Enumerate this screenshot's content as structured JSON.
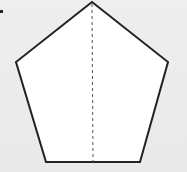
{
  "diagram": {
    "shape": "regular-pentagon",
    "fill": "#ffffff",
    "stroke": "#222222",
    "stroke_width": 2,
    "vertices": [
      [
        92,
        2
      ],
      [
        168,
        62
      ],
      [
        140,
        162
      ],
      [
        46,
        162
      ],
      [
        16,
        62
      ]
    ],
    "symmetry_line": {
      "style": "dashed",
      "color": "#555555",
      "x1": 92,
      "y1": 4,
      "x2": 93,
      "y2": 162
    },
    "marker_dot": {
      "x": 0,
      "y": 10
    }
  }
}
